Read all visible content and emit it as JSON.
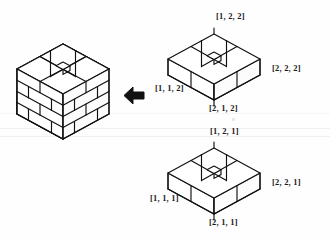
{
  "figure": {
    "kind": "isometric-block-assembly-diagram",
    "arrow": {
      "name": "left-arrow",
      "direction": "left",
      "glyph": "←",
      "color": "#111111"
    },
    "assembled": {
      "name": "assembled-brick-tower",
      "layers": 4,
      "bricks_per_layer": 4
    },
    "layer_top": {
      "name": "layer-two",
      "labels": {
        "back": "[1, 2, 2]",
        "right": "[2, 2, 2]",
        "left": "[1, 1, 2]",
        "front": "[2, 1, 2]"
      }
    },
    "layer_bottom": {
      "name": "layer-one",
      "labels": {
        "back": "[1, 2, 1]",
        "right": "[2, 2, 1]",
        "left": "[1, 1, 1]",
        "front": "[2, 1, 1]"
      }
    },
    "colors": {
      "ink": "#111111",
      "paper": "#fefefe",
      "face_light": "#ffffff",
      "face_shade": "#fbfbfb"
    }
  }
}
